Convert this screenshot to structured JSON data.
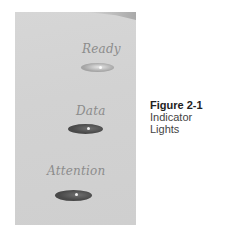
{
  "figure": {
    "number": "Figure 2-1",
    "title_line1": "Indicator",
    "title_line2": "Lights"
  },
  "indicators": [
    {
      "label": "Ready",
      "state": "light"
    },
    {
      "label": "Data",
      "state": "dark"
    },
    {
      "label": "Attention",
      "state": "dark"
    }
  ]
}
